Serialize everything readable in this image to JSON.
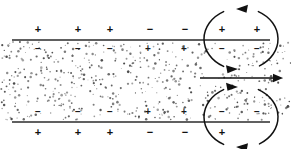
{
  "figure": {
    "type": "physics-schematic",
    "width": 291,
    "height": 149,
    "background_color": "#ffffff",
    "ink_color": "#111111",
    "stipple_color": "#4a4a4a"
  },
  "slab": {
    "label": "stippled-fluid-band",
    "left": 0,
    "right": 291,
    "top": 40,
    "bottom": 122,
    "top_plate_y": 40,
    "bottom_plate_y": 122,
    "plate_left_x": 12,
    "plate_right_x": 270,
    "dot_count": 560
  },
  "charges": {
    "top_outer": {
      "label": "charges-above-top-plate",
      "y": 30,
      "items": [
        {
          "symbol": "+",
          "x": 38
        },
        {
          "symbol": "+",
          "x": 78
        },
        {
          "symbol": "+",
          "x": 110
        },
        {
          "symbol": "−",
          "x": 150
        },
        {
          "symbol": "−",
          "x": 185
        }
      ]
    },
    "top_inner": {
      "label": "charges-below-top-plate",
      "y": 49,
      "items": [
        {
          "symbol": "−",
          "x": 38
        },
        {
          "symbol": "−",
          "x": 78
        },
        {
          "symbol": "−",
          "x": 110
        },
        {
          "symbol": "+",
          "x": 148
        },
        {
          "symbol": "+",
          "x": 184
        }
      ]
    },
    "bottom_inner": {
      "label": "charges-above-bottom-plate",
      "y": 112,
      "items": [
        {
          "symbol": "−",
          "x": 38
        },
        {
          "symbol": "−",
          "x": 78
        },
        {
          "symbol": "−",
          "x": 110
        },
        {
          "symbol": "+",
          "x": 148
        },
        {
          "symbol": "+",
          "x": 184
        }
      ]
    },
    "bottom_outer": {
      "label": "charges-below-bottom-plate",
      "y": 133,
      "items": [
        {
          "symbol": "+",
          "x": 38
        },
        {
          "symbol": "+",
          "x": 78
        },
        {
          "symbol": "+",
          "x": 110
        },
        {
          "symbol": "−",
          "x": 150
        },
        {
          "symbol": "−",
          "x": 185
        }
      ]
    },
    "top_vortex_outer": {
      "label": "charges-inside-top-vortex-above-line",
      "y": 30,
      "items": [
        {
          "symbol": "+",
          "x": 222
        },
        {
          "symbol": "+",
          "x": 257
        }
      ]
    },
    "top_vortex_inner": {
      "label": "charges-inside-top-vortex-below-line",
      "y": 49,
      "items": [
        {
          "symbol": "−",
          "x": 222
        },
        {
          "symbol": "−",
          "x": 257
        }
      ]
    },
    "bottom_vortex_inner": {
      "label": "charges-inside-bottom-vortex-above-line",
      "y": 112,
      "items": [
        {
          "symbol": "−",
          "x": 222
        },
        {
          "symbol": "−",
          "x": 257
        }
      ]
    },
    "bottom_vortex_outer": {
      "label": "charges-inside-bottom-vortex-below-line",
      "y": 133,
      "items": [
        {
          "symbol": "+",
          "x": 222
        }
      ]
    }
  },
  "vortices": [
    {
      "name": "top-right-vortex",
      "cx": 241,
      "cy": 39,
      "rx": 37,
      "ry": 31,
      "direction": "counterclockwise",
      "top_arrow_direction": "left",
      "bottom_arrow_direction": "right"
    },
    {
      "name": "bottom-right-vortex",
      "cx": 241,
      "cy": 117,
      "rx": 37,
      "ry": 31,
      "direction": "clockwise",
      "top_arrow_direction": "right",
      "bottom_arrow_direction": "left"
    }
  ],
  "flow_arrow": {
    "name": "center-flow-arrow",
    "direction": "right",
    "x_start": 200,
    "x_end": 283,
    "y": 78
  }
}
